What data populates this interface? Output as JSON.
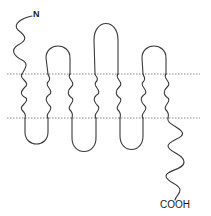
{
  "diagram": {
    "type": "membrane protein topology (seven-transmembrane receptor)",
    "n_terminus_label": "N",
    "c_terminus_label": "COOH",
    "transmembrane_helices": 7,
    "membrane_boundary_style": "dotted",
    "colors": {
      "line": "#3a3a3a",
      "membrane": "#8a8a8a",
      "background": "#ffffff"
    }
  }
}
